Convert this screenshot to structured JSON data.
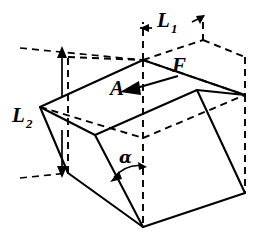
{
  "figure": {
    "type": "engineering-diagram",
    "background_color": "#ffffff",
    "line_color": "#000000",
    "labels": {
      "length_1": {
        "symbol": "L",
        "subscript": "1",
        "full": "L1",
        "meaning": "horizontal top dimension"
      },
      "length_2": {
        "symbol": "L",
        "subscript": "2",
        "full": "L2",
        "meaning": "vertical height dimension"
      },
      "area": {
        "symbol": "A",
        "meaning": "top face area"
      },
      "force": {
        "symbol": "F",
        "meaning": "applied force on top face"
      },
      "angle": {
        "symbol": "α",
        "meaning": "inclination angle of wedge face"
      }
    },
    "geometry": {
      "top_face": [
        [
          40,
          107
        ],
        [
          143,
          60
        ],
        [
          245,
          95
        ],
        [
          143,
          138
        ]
      ],
      "left_face": [
        [
          40,
          107
        ],
        [
          95,
          135
        ],
        [
          143,
          227
        ],
        [
          68,
          173
        ]
      ],
      "right_face": [
        [
          143,
          138
        ],
        [
          245,
          95
        ],
        [
          245,
          193
        ],
        [
          143,
          227
        ]
      ],
      "front_face": [
        [
          95,
          135
        ],
        [
          143,
          138
        ],
        [
          143,
          227
        ]
      ],
      "bounding_box_dashed": true
    },
    "dimensions": {
      "l1_arrow_left_x": 140,
      "l1_arrow_right_x": 203,
      "l1_y": 28,
      "l2_arrow_top_y": 52,
      "l2_arrow_bottom_y": 172,
      "l2_x": 62
    }
  }
}
